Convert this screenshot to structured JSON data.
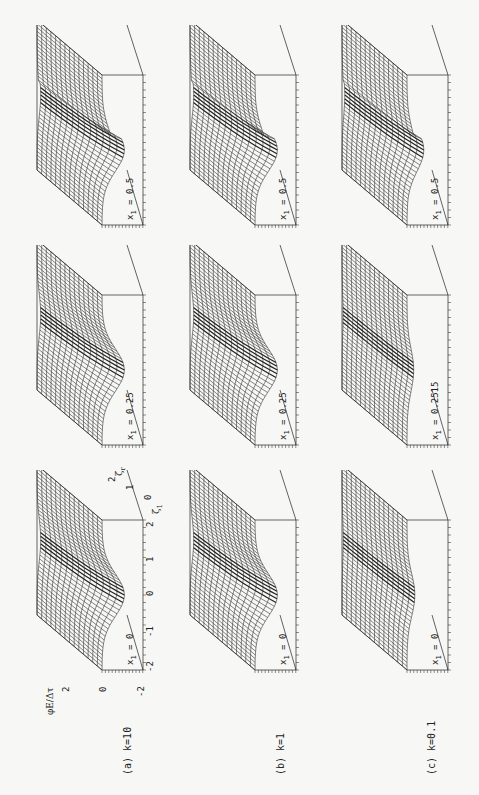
{
  "figure": {
    "rotation_deg": -90,
    "columns": [
      {
        "id": "a",
        "caption": "(a) k=10",
        "k": 10
      },
      {
        "id": "b",
        "caption": "(b) k=1",
        "k": 1
      },
      {
        "id": "c",
        "caption": "(c) k=0.1",
        "k": 0.1
      }
    ],
    "panels": [
      {
        "col": "a",
        "row": "top",
        "label_var": "x",
        "label_sub": "1",
        "label_val": " = 0.5"
      },
      {
        "col": "a",
        "row": "middle",
        "label_var": "x",
        "label_sub": "1",
        "label_val": " = 0.25"
      },
      {
        "col": "a",
        "row": "bottom",
        "label_var": "x",
        "label_sub": "1",
        "label_val": " = 0"
      },
      {
        "col": "b",
        "row": "top",
        "label_var": "x",
        "label_sub": "1",
        "label_val": " = 0.5"
      },
      {
        "col": "b",
        "row": "middle",
        "label_var": "x",
        "label_sub": "1",
        "label_val": " = 0.25"
      },
      {
        "col": "b",
        "row": "bottom",
        "label_var": "x",
        "label_sub": "1",
        "label_val": " = 0"
      },
      {
        "col": "c",
        "row": "top",
        "label_var": "x",
        "label_sub": "1",
        "label_val": " = 0.5"
      },
      {
        "col": "c",
        "row": "middle",
        "label_var": "x",
        "label_sub": "1",
        "label_val": " = 0.2515"
      },
      {
        "col": "c",
        "row": "bottom",
        "label_var": "x",
        "label_sub": "1",
        "label_val": " = 0"
      }
    ],
    "axes": {
      "z_label": "φE/Δτ",
      "z_ticks": [
        "2",
        "0",
        "-2"
      ],
      "zeta1_label": "ζ",
      "zeta1_sub": "1",
      "zeta1_ticks": [
        "-2",
        "-1",
        "0",
        "1",
        "2"
      ],
      "zetar_label": "ζ",
      "zetar_sub": "r",
      "zetar_ticks": [
        "0",
        "1",
        "2"
      ]
    }
  },
  "chart_data": {
    "type": "surface",
    "title": "",
    "layout": "3x3 grid of 3D wireframe surfaces (figure rotated 90°)",
    "zlabel": "φE/Δτ",
    "xlabel": "ζ1",
    "ylabel": "ζr",
    "zlim": [
      -2,
      2
    ],
    "xlim": [
      -2,
      2
    ],
    "ylim": [
      0,
      2
    ],
    "x_ticks": [
      -2,
      -1,
      0,
      1,
      2
    ],
    "y_ticks": [
      0,
      1,
      2
    ],
    "z_ticks": [
      -2,
      0,
      2
    ],
    "series": [
      {
        "name": "k=10, x1=0",
        "depression_depth": "large"
      },
      {
        "name": "k=10, x1=0.25",
        "depression_depth": "large"
      },
      {
        "name": "k=10, x1=0.5",
        "depression_depth": "large, with vertical discontinuity"
      },
      {
        "name": "k=1, x1=0",
        "depression_depth": "large"
      },
      {
        "name": "k=1, x1=0.25",
        "depression_depth": "large"
      },
      {
        "name": "k=1, x1=0.5",
        "depression_depth": "large, with vertical discontinuity"
      },
      {
        "name": "k=0.1, x1=0",
        "depression_depth": "small"
      },
      {
        "name": "k=0.1, x1=0.2515",
        "depression_depth": "small"
      },
      {
        "name": "k=0.1, x1=0.5",
        "depression_depth": "moderate, with vertical discontinuity"
      }
    ]
  }
}
